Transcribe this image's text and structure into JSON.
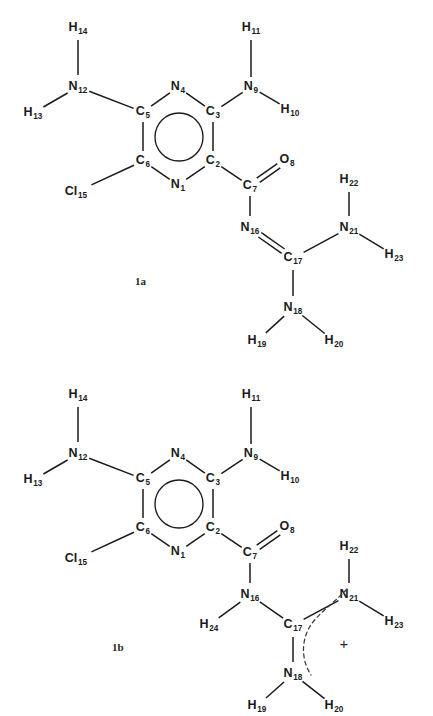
{
  "page": {
    "background_color": "#ffffff",
    "line_color": "#1b1b1b",
    "text_color": "#1b1b1b",
    "width": 433,
    "height": 716
  },
  "structures": [
    {
      "id": "1a",
      "caption": "1a",
      "caption_pos": {
        "x": 135,
        "y": 285
      },
      "atoms": [
        {
          "key": "N1",
          "element": "N",
          "index": "1",
          "x": 178,
          "y": 185,
          "anchor": "middle"
        },
        {
          "key": "C2",
          "element": "C",
          "index": "2",
          "x": 213,
          "y": 161,
          "anchor": "middle"
        },
        {
          "key": "C3",
          "element": "C",
          "index": "3",
          "x": 213,
          "y": 112,
          "anchor": "middle"
        },
        {
          "key": "N4",
          "element": "N",
          "index": "4",
          "x": 178,
          "y": 87,
          "anchor": "middle"
        },
        {
          "key": "C5",
          "element": "C",
          "index": "5",
          "x": 143,
          "y": 112,
          "anchor": "middle"
        },
        {
          "key": "C6",
          "element": "C",
          "index": "6",
          "x": 143,
          "y": 161,
          "anchor": "middle"
        },
        {
          "key": "C7",
          "element": "C",
          "index": "7",
          "x": 250,
          "y": 186,
          "anchor": "middle"
        },
        {
          "key": "O8",
          "element": "O",
          "index": "8",
          "x": 287,
          "y": 160,
          "anchor": "middle"
        },
        {
          "key": "N9",
          "element": "N",
          "index": "9",
          "x": 251,
          "y": 87,
          "anchor": "middle"
        },
        {
          "key": "H10",
          "element": "H",
          "index": "10",
          "x": 290,
          "y": 110,
          "anchor": "middle"
        },
        {
          "key": "H11",
          "element": "H",
          "index": "11",
          "x": 251,
          "y": 28,
          "anchor": "middle"
        },
        {
          "key": "N12",
          "element": "N",
          "index": "12",
          "x": 78,
          "y": 87,
          "anchor": "middle"
        },
        {
          "key": "H13",
          "element": "H",
          "index": "13",
          "x": 33,
          "y": 113,
          "anchor": "middle"
        },
        {
          "key": "H14",
          "element": "H",
          "index": "14",
          "x": 78,
          "y": 28,
          "anchor": "middle"
        },
        {
          "key": "Cl15",
          "element": "Cl",
          "index": "15",
          "x": 76,
          "y": 192,
          "anchor": "middle"
        },
        {
          "key": "N16",
          "element": "N",
          "index": "16",
          "x": 250,
          "y": 228,
          "anchor": "middle"
        },
        {
          "key": "C17",
          "element": "C",
          "index": "17",
          "x": 293,
          "y": 258,
          "anchor": "middle"
        },
        {
          "key": "N18",
          "element": "N",
          "index": "18",
          "x": 293,
          "y": 308,
          "anchor": "middle"
        },
        {
          "key": "H19",
          "element": "H",
          "index": "19",
          "x": 257,
          "y": 341,
          "anchor": "middle"
        },
        {
          "key": "H20",
          "element": "H",
          "index": "20",
          "x": 334,
          "y": 341,
          "anchor": "middle"
        },
        {
          "key": "N21",
          "element": "N",
          "index": "21",
          "x": 349,
          "y": 228,
          "anchor": "middle"
        },
        {
          "key": "H22",
          "element": "H",
          "index": "22",
          "x": 349,
          "y": 180,
          "anchor": "middle"
        },
        {
          "key": "H23",
          "element": "H",
          "index": "23",
          "x": 394,
          "y": 255,
          "anchor": "middle"
        }
      ],
      "bonds": [
        {
          "from": "N1",
          "to": "C2",
          "order": 1
        },
        {
          "from": "C2",
          "to": "C3",
          "order": 1
        },
        {
          "from": "C3",
          "to": "N4",
          "order": 1
        },
        {
          "from": "N4",
          "to": "C5",
          "order": 1
        },
        {
          "from": "C5",
          "to": "C6",
          "order": 1
        },
        {
          "from": "C6",
          "to": "N1",
          "order": 1
        },
        {
          "from": "C2",
          "to": "C7",
          "order": 1
        },
        {
          "from": "C7",
          "to": "O8",
          "order": 2
        },
        {
          "from": "C3",
          "to": "N9",
          "order": 1
        },
        {
          "from": "N9",
          "to": "H10",
          "order": 1
        },
        {
          "from": "N9",
          "to": "H11",
          "order": 1
        },
        {
          "from": "C5",
          "to": "N12",
          "order": 1
        },
        {
          "from": "N12",
          "to": "H13",
          "order": 1
        },
        {
          "from": "N12",
          "to": "H14",
          "order": 1
        },
        {
          "from": "C6",
          "to": "Cl15",
          "order": 1
        },
        {
          "from": "C7",
          "to": "N16",
          "order": 1
        },
        {
          "from": "N16",
          "to": "C17",
          "order": 2
        },
        {
          "from": "C17",
          "to": "N18",
          "order": 1
        },
        {
          "from": "N18",
          "to": "H19",
          "order": 1
        },
        {
          "from": "N18",
          "to": "H20",
          "order": 1
        },
        {
          "from": "C17",
          "to": "N21",
          "order": 1
        },
        {
          "from": "N21",
          "to": "H22",
          "order": 1
        },
        {
          "from": "N21",
          "to": "H23",
          "order": 1
        }
      ],
      "aromatic_ring": {
        "cx": 179,
        "cy": 137,
        "r": 24
      },
      "charge": null
    },
    {
      "id": "1b",
      "caption": "1b",
      "caption_pos": {
        "x": 112,
        "y": 651
      },
      "atoms": [
        {
          "key": "N1",
          "element": "N",
          "index": "1",
          "x": 178,
          "y": 552,
          "anchor": "middle"
        },
        {
          "key": "C2",
          "element": "C",
          "index": "2",
          "x": 213,
          "y": 528,
          "anchor": "middle"
        },
        {
          "key": "C3",
          "element": "C",
          "index": "3",
          "x": 213,
          "y": 479,
          "anchor": "middle"
        },
        {
          "key": "N4",
          "element": "N",
          "index": "4",
          "x": 178,
          "y": 454,
          "anchor": "middle"
        },
        {
          "key": "C5",
          "element": "C",
          "index": "5",
          "x": 143,
          "y": 479,
          "anchor": "middle"
        },
        {
          "key": "C6",
          "element": "C",
          "index": "6",
          "x": 143,
          "y": 528,
          "anchor": "middle"
        },
        {
          "key": "C7",
          "element": "C",
          "index": "7",
          "x": 250,
          "y": 553,
          "anchor": "middle"
        },
        {
          "key": "O8",
          "element": "O",
          "index": "8",
          "x": 287,
          "y": 527,
          "anchor": "middle"
        },
        {
          "key": "N9",
          "element": "N",
          "index": "9",
          "x": 251,
          "y": 454,
          "anchor": "middle"
        },
        {
          "key": "H10",
          "element": "H",
          "index": "10",
          "x": 290,
          "y": 477,
          "anchor": "middle"
        },
        {
          "key": "H11",
          "element": "H",
          "index": "11",
          "x": 251,
          "y": 395,
          "anchor": "middle"
        },
        {
          "key": "N12",
          "element": "N",
          "index": "12",
          "x": 78,
          "y": 454,
          "anchor": "middle"
        },
        {
          "key": "H13",
          "element": "H",
          "index": "13",
          "x": 33,
          "y": 480,
          "anchor": "middle"
        },
        {
          "key": "H14",
          "element": "H",
          "index": "14",
          "x": 78,
          "y": 395,
          "anchor": "middle"
        },
        {
          "key": "Cl15",
          "element": "Cl",
          "index": "15",
          "x": 76,
          "y": 559,
          "anchor": "middle"
        },
        {
          "key": "N16",
          "element": "N",
          "index": "16",
          "x": 250,
          "y": 595,
          "anchor": "middle"
        },
        {
          "key": "C17",
          "element": "C",
          "index": "17",
          "x": 293,
          "y": 625,
          "anchor": "middle"
        },
        {
          "key": "N18",
          "element": "N",
          "index": "18",
          "x": 293,
          "y": 674,
          "anchor": "middle"
        },
        {
          "key": "H19",
          "element": "H",
          "index": "19",
          "x": 257,
          "y": 706,
          "anchor": "middle"
        },
        {
          "key": "H20",
          "element": "H",
          "index": "20",
          "x": 334,
          "y": 706,
          "anchor": "middle"
        },
        {
          "key": "N21",
          "element": "N",
          "index": "21",
          "x": 349,
          "y": 595,
          "anchor": "middle"
        },
        {
          "key": "H22",
          "element": "H",
          "index": "22",
          "x": 349,
          "y": 547,
          "anchor": "middle"
        },
        {
          "key": "H23",
          "element": "H",
          "index": "23",
          "x": 394,
          "y": 622,
          "anchor": "middle"
        },
        {
          "key": "H24",
          "element": "H",
          "index": "24",
          "x": 209,
          "y": 625,
          "anchor": "middle"
        }
      ],
      "bonds": [
        {
          "from": "N1",
          "to": "C2",
          "order": 1
        },
        {
          "from": "C2",
          "to": "C3",
          "order": 1
        },
        {
          "from": "C3",
          "to": "N4",
          "order": 1
        },
        {
          "from": "N4",
          "to": "C5",
          "order": 1
        },
        {
          "from": "C5",
          "to": "C6",
          "order": 1
        },
        {
          "from": "C6",
          "to": "N1",
          "order": 1
        },
        {
          "from": "C2",
          "to": "C7",
          "order": 1
        },
        {
          "from": "C7",
          "to": "O8",
          "order": 2
        },
        {
          "from": "C3",
          "to": "N9",
          "order": 1
        },
        {
          "from": "N9",
          "to": "H10",
          "order": 1
        },
        {
          "from": "N9",
          "to": "H11",
          "order": 1
        },
        {
          "from": "C5",
          "to": "N12",
          "order": 1
        },
        {
          "from": "N12",
          "to": "H13",
          "order": 1
        },
        {
          "from": "N12",
          "to": "H14",
          "order": 1
        },
        {
          "from": "C6",
          "to": "Cl15",
          "order": 1
        },
        {
          "from": "C7",
          "to": "N16",
          "order": 1
        },
        {
          "from": "N16",
          "to": "H24",
          "order": 1
        },
        {
          "from": "N16",
          "to": "C17",
          "order": 1
        },
        {
          "from": "C17",
          "to": "N18",
          "order": 1
        },
        {
          "from": "N18",
          "to": "H19",
          "order": 1
        },
        {
          "from": "N18",
          "to": "H20",
          "order": 1
        },
        {
          "from": "C17",
          "to": "N21",
          "order": 1
        },
        {
          "from": "N21",
          "to": "H22",
          "order": 1
        },
        {
          "from": "N21",
          "to": "H23",
          "order": 1
        }
      ],
      "aromatic_ring": {
        "cx": 179,
        "cy": 504,
        "r": 24
      },
      "charge": {
        "symbol": "+",
        "x": 344,
        "y": 645,
        "arc_path": "M 347 589 C 333 604 317 614 309 628 C 300 645 303 663 311 675"
      }
    }
  ]
}
